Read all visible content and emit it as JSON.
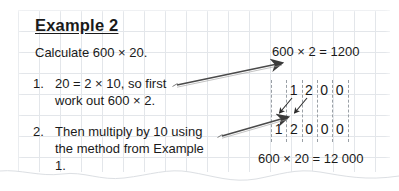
{
  "worksheet": {
    "title": "Example 2",
    "instruction": "Calculate 600 × 20.",
    "steps": [
      {
        "number": "1.",
        "text": "20 = 2 × 10, so first\nwork out 600 × 2."
      },
      {
        "number": "2.",
        "text": "Then multiply by 10 using\nthe method from Example 1."
      }
    ],
    "equations": {
      "top": "600 × 2 = 1200",
      "bottom": "600 × 20 = 12 000"
    },
    "place_value_chart": {
      "top_row": [
        "1",
        "2",
        "0",
        "0"
      ],
      "bottom_row": [
        "1",
        "2",
        "0",
        "0",
        "0"
      ],
      "column_count": 6,
      "shift_arrow_count": 2
    },
    "pointer_arrows": [
      {
        "name": "arrow-to-equation",
        "from_step": "1."
      },
      {
        "name": "arrow-to-chart",
        "from_step": "2."
      }
    ],
    "colors": {
      "ink": "#1a1a1a",
      "grid": "#e3e6ea",
      "chart_column": "#9aa0a6",
      "paper": "#ffffff"
    }
  }
}
